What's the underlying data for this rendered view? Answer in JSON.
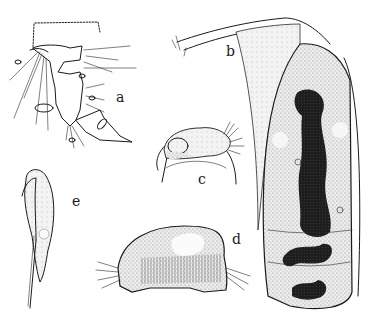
{
  "plate": {
    "description": "Plate of five stippled pen-and-ink biological illustrations",
    "figures": [
      {
        "id": "a",
        "label": "a",
        "subject": "segmented appendage with setae and claw"
      },
      {
        "id": "b",
        "label": "b",
        "subject": "elongate cell/body with dark central nuclear mass and stalk"
      },
      {
        "id": "c",
        "label": "c",
        "subject": "small ciliated organism on curved stalk"
      },
      {
        "id": "d",
        "label": "d",
        "subject": "dome-shaped stippled body with striations and cilia"
      },
      {
        "id": "e",
        "label": "e",
        "subject": "elongate spindle-shaped body with long tail"
      }
    ]
  },
  "colors": {
    "ink": "#1a1a1a",
    "stipple": "#c8c8c8",
    "nucleus": "#222222",
    "background": "#ffffff"
  }
}
